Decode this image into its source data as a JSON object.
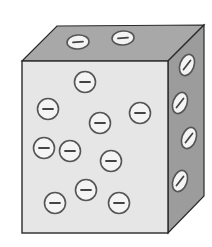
{
  "diagram": {
    "title": "",
    "colors": {
      "background": "#ffffff",
      "front_face": "#e6e6e6",
      "top_face": "#a8a8a8",
      "side_face": "#9c9c9c",
      "edge": "#2a2a2a",
      "charge_fill": "#f4f4f4",
      "charge_stroke": "#555555",
      "charge_sign": "#444444"
    },
    "charge_symbol": "−",
    "front_charges": [
      {
        "cx": 85,
        "cy": 82
      },
      {
        "cx": 48,
        "cy": 109
      },
      {
        "cx": 100,
        "cy": 123
      },
      {
        "cx": 140,
        "cy": 113
      },
      {
        "cx": 44,
        "cy": 148
      },
      {
        "cx": 70,
        "cy": 151
      },
      {
        "cx": 111,
        "cy": 161
      },
      {
        "cx": 86,
        "cy": 190
      },
      {
        "cx": 55,
        "cy": 203
      },
      {
        "cx": 119,
        "cy": 203
      }
    ],
    "top_charges": [
      {
        "cx": 78,
        "cy": 42
      },
      {
        "cx": 123,
        "cy": 38
      }
    ],
    "side_charges": [
      {
        "cx": 187,
        "cy": 65
      },
      {
        "cx": 180,
        "cy": 103
      },
      {
        "cx": 189,
        "cy": 138
      },
      {
        "cx": 180,
        "cy": 181
      }
    ],
    "charge_count": 16
  }
}
